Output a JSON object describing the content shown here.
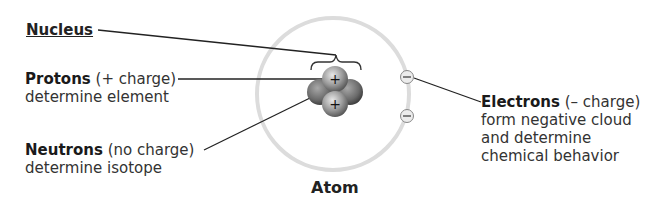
{
  "labels": {
    "nucleus": {
      "title": "Nucleus"
    },
    "protons": {
      "title": "Protons",
      "charge": "(+ charge)",
      "description": "determine element"
    },
    "neutrons": {
      "title": "Neutrons",
      "charge": "(no charge)",
      "description": "determine isotope"
    },
    "electrons": {
      "title": "Electrons",
      "charge": "(– charge)",
      "description_lines": [
        "form negative cloud",
        "and determine",
        "chemical behavior"
      ]
    },
    "atom": {
      "title": "Atom"
    }
  },
  "symbols": {
    "proton": "+",
    "electron": "–"
  },
  "colors": {
    "orbit": "#d9d9d9",
    "proton": "#9a9a9a",
    "neutron": "#6e6e6e",
    "electron_fill": "#e6e6e6",
    "leader": "#222222"
  }
}
